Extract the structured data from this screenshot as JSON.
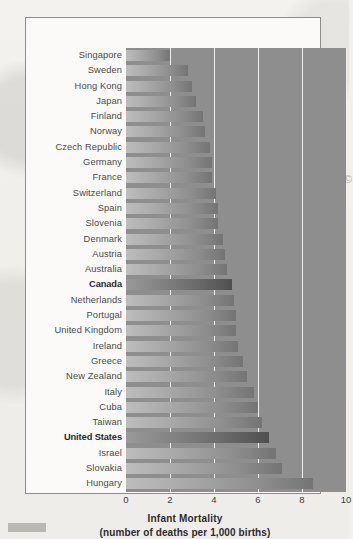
{
  "chart_data": {
    "type": "bar",
    "orientation": "horizontal",
    "title": "Infant Mortality",
    "subtitle": "(number of deaths per 1,000 births)",
    "xlabel": "Infant Mortality",
    "ylabel": "",
    "xlim": [
      0,
      10
    ],
    "xticks": [
      "0",
      "2",
      "4",
      "6",
      "8",
      "10"
    ],
    "xtick_values": [
      0,
      2,
      4,
      6,
      8,
      10
    ],
    "grid": "vertical-white-gridlines",
    "legend": "none",
    "highlighted": [
      "Canada",
      "United States"
    ],
    "categories": [
      "Singapore",
      "Sweden",
      "Hong Kong",
      "Japan",
      "Finland",
      "Norway",
      "Czech Republic",
      "Germany",
      "France",
      "Switzerland",
      "Spain",
      "Slovenia",
      "Denmark",
      "Austria",
      "Australia",
      "Canada",
      "Netherlands",
      "Portugal",
      "United Kingdom",
      "Ireland",
      "Greece",
      "New Zealand",
      "Italy",
      "Cuba",
      "Taiwan",
      "United States",
      "Israel",
      "Slovakia",
      "Hungary"
    ],
    "values": [
      2.0,
      2.8,
      3.0,
      3.2,
      3.5,
      3.6,
      3.8,
      3.9,
      3.9,
      4.1,
      4.2,
      4.2,
      4.4,
      4.5,
      4.6,
      4.8,
      4.9,
      5.0,
      5.0,
      5.1,
      5.3,
      5.5,
      5.8,
      6.0,
      6.2,
      6.5,
      6.8,
      7.1,
      8.5
    ],
    "unit": "deaths per 1,000 live births",
    "colors": {
      "plot_background": "#8e8e8e",
      "bar_light": "#bdbdbd",
      "bar_dark": "#747474",
      "bar_highlight_light": "#9a9a9a",
      "bar_highlight_dark": "#4f4f4f",
      "gridline": "#efefee",
      "frame": "#8d8d8d",
      "page_background": "#f2f0ec",
      "label_text": "#4a4a4a"
    }
  },
  "marks": {
    "smudge_glyph": "©"
  }
}
